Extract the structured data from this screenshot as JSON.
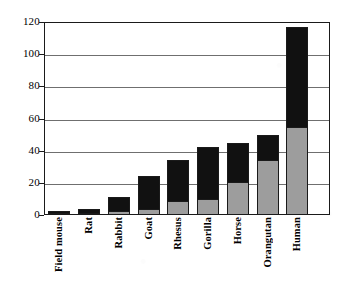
{
  "chart_data": {
    "type": "bar",
    "title": "",
    "subtitle": "",
    "xlabel": "",
    "ylabel": "",
    "grid": true,
    "legend_position": "none",
    "stacked": true,
    "ylim": [
      0,
      120
    ],
    "yticks": [
      0,
      20,
      40,
      60,
      80,
      100,
      120
    ],
    "ytick_labels": [
      "0",
      "20",
      "40",
      "60",
      "80",
      "100",
      "120"
    ],
    "categories": [
      "Field mouse",
      "Rat",
      "Rabbit",
      "Goat",
      "Rhesus",
      "Gorilla",
      "Horse",
      "Orangutan",
      "Human"
    ],
    "series": [
      {
        "name": "lower-segment",
        "color": "#9d9d9d",
        "values": [
          1,
          1,
          2.5,
          3.5,
          9,
          10,
          20.5,
          34.5,
          55
        ]
      },
      {
        "name": "upper-segment",
        "color": "#111111",
        "values": [
          1.5,
          2.5,
          9,
          20.5,
          25,
          32.5,
          24.5,
          15,
          62
        ]
      }
    ],
    "totals": [
      2.5,
      3.5,
      11.5,
      24,
      34,
      42.5,
      45,
      49.5,
      117
    ],
    "colors": {
      "upper": "#111111",
      "lower": "#9d9d9d",
      "axis": "#1a1a1a",
      "grid": "#6f6f6f",
      "background": "#ffffff"
    }
  }
}
